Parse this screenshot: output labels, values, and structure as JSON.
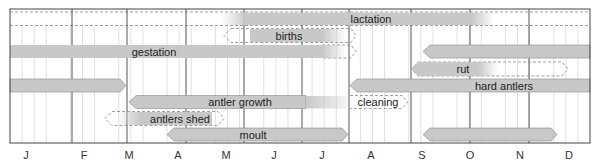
{
  "chart_data": {
    "type": "table",
    "title": "",
    "subtitle": "",
    "xlabel": "",
    "ylabel": "",
    "months": [
      "J",
      "F",
      "M",
      "A",
      "M",
      "J",
      "J",
      "A",
      "S",
      "O",
      "N",
      "D"
    ],
    "grid": {
      "major": "month",
      "minor": "week",
      "on": true
    },
    "legend": null,
    "note": "Annual cycle of deer. Bars measured in months from Jan 1 (0) to Dec 31 (12). Solid grey = main period, dashed outline = variable/extended period. Arrow tips indicate continuation/fading.",
    "rows": [
      {
        "label": "lactation",
        "row": 1,
        "segments": [
          {
            "start": 0.0,
            "end": 5.0,
            "style": "dashed"
          },
          {
            "start": 5.0,
            "end": 9.8,
            "style": "solid",
            "fade_left": true,
            "fade_right": true
          },
          {
            "start": 9.8,
            "end": 12.0,
            "style": "dashed"
          }
        ]
      },
      {
        "label": "births",
        "row": 2,
        "segments": [
          {
            "start": 4.5,
            "end": 5.0,
            "style": "dashed",
            "arrow_left": true
          },
          {
            "start": 5.0,
            "end": 6.5,
            "style": "solid",
            "fade_right": true
          },
          {
            "start": 6.5,
            "end": 7.0,
            "style": "dashed",
            "arrow_right": true
          }
        ]
      },
      {
        "label": "gestation",
        "row": 3,
        "segments": [
          {
            "start": 0.0,
            "end": 6.5,
            "style": "solid",
            "fade_right": true
          },
          {
            "start": 6.5,
            "end": 7.0,
            "style": "dashed",
            "arrow_right": true
          },
          {
            "start": 8.5,
            "end": 12.0,
            "style": "solid",
            "arrow_left": true
          }
        ]
      },
      {
        "label": "rut",
        "row": 4,
        "segments": [
          {
            "start": 8.4,
            "end": 9.8,
            "style": "solid",
            "arrow_left": true,
            "fade_right": true
          },
          {
            "start": 9.8,
            "end": 11.5,
            "style": "dashed",
            "arrow_right": true
          }
        ]
      },
      {
        "label": "hard antlers",
        "row": 5,
        "segments": [
          {
            "start": 0.0,
            "end": 2.0,
            "style": "solid",
            "arrow_right": true
          },
          {
            "start": 7.0,
            "end": 12.0,
            "style": "solid",
            "arrow_left": true
          }
        ]
      },
      {
        "label": "antler growth",
        "row": 6,
        "segments": [
          {
            "start": 2.5,
            "end": 6.5,
            "style": "solid",
            "arrow_left": true,
            "fade_right": true
          }
        ]
      },
      {
        "label": "cleaning",
        "row": 6,
        "segments": [
          {
            "start": 6.5,
            "end": 8.0,
            "style": "dashed",
            "arrow_right": true
          }
        ]
      },
      {
        "label": "antlers shed",
        "row": 7,
        "segments": [
          {
            "start": 2.0,
            "end": 2.5,
            "style": "dashed",
            "arrow_left": true
          },
          {
            "start": 2.5,
            "end": 4.0,
            "style": "solid",
            "fade_left": true
          },
          {
            "start": 4.0,
            "end": 4.5,
            "style": "dashed",
            "arrow_right": true
          }
        ]
      },
      {
        "label": "moult",
        "row": 8,
        "segments": [
          {
            "start": 3.2,
            "end": 7.0,
            "style": "solid",
            "arrow_left": true,
            "arrow_right": true
          },
          {
            "start": 8.5,
            "end": 11.3,
            "style": "solid",
            "arrow_left": true,
            "arrow_right": true
          }
        ]
      }
    ]
  },
  "labels": {
    "lactation": "lactation",
    "births": "births",
    "gestation": "gestation",
    "rut": "rut",
    "hard_antlers": "hard antlers",
    "antler_growth": "antler growth",
    "cleaning": "cleaning",
    "antlers_shed": "antlers shed",
    "moult": "moult"
  },
  "month_labels": [
    "J",
    "F",
    "M",
    "A",
    "M",
    "J",
    "J",
    "A",
    "S",
    "O",
    "N",
    "D"
  ],
  "colors": {
    "bar_fill": "#c8c8c8",
    "bar_stroke": "#8a8a8a",
    "dashed_stroke": "#888888",
    "grid_major": "#444444",
    "grid_minor": "#d4d4d4",
    "text": "#222222"
  }
}
